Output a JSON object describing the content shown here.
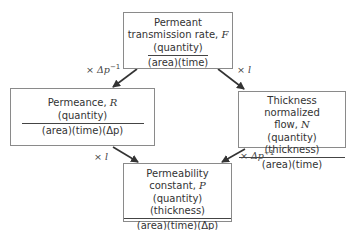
{
  "boxes": {
    "top": {
      "title_line1": "Permeant",
      "title_line2": "transmission rate, ",
      "var": "F",
      "numerator": "(quantity)",
      "denominator": "(area)(time)"
    },
    "left": {
      "title_line1": "Permeance, ",
      "var": "R",
      "numerator": "(quantity)",
      "denominator": "(area)(time)(Δp)"
    },
    "right": {
      "title_line1": "Thickness normalized",
      "title_line2": "flow, ",
      "var": "N",
      "numerator": "(quantity)(thickness)",
      "denominator": "(area)(time)"
    },
    "bottom": {
      "title_line1": "Permeability",
      "title_line2": "constant, ",
      "var": "P",
      "numerator": "(quantity)(thickness)",
      "denominator": "(area)(time)(Δp)"
    }
  },
  "arrows": {
    "top_to_left": {
      "prefix": "× ",
      "symbol": "Δp",
      "sup": "−1"
    },
    "top_to_right": {
      "prefix": "× ",
      "symbol": "l",
      "sup": ""
    },
    "left_to_bottom": {
      "prefix": "× ",
      "symbol": "l",
      "sup": ""
    },
    "right_to_bottom": {
      "prefix": "× ",
      "symbol": "Δp",
      "sup": "−1"
    }
  }
}
